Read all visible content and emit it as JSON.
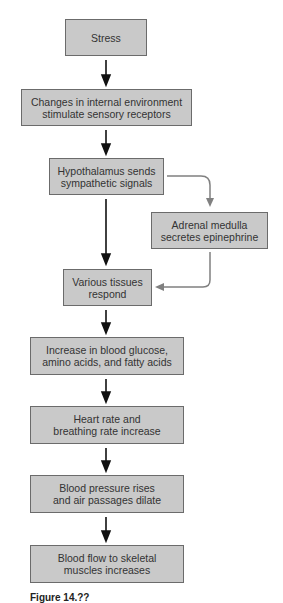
{
  "diagram": {
    "type": "flowchart",
    "nodes": [
      {
        "id": "stress",
        "label": "Stress"
      },
      {
        "id": "changes",
        "label": "Changes in internal environment\nstimulate sensory receptors"
      },
      {
        "id": "hypothalamus",
        "label": "Hypothalamus sends\nsympathetic signals"
      },
      {
        "id": "adrenal",
        "label": "Adrenal medulla\nsecretes epinephrine"
      },
      {
        "id": "tissues",
        "label": "Various tissues\nrespond"
      },
      {
        "id": "glucose",
        "label": "Increase in blood glucose,\namino acids, and fatty acids"
      },
      {
        "id": "heart",
        "label": "Heart rate and\nbreathing rate increase"
      },
      {
        "id": "pressure",
        "label": "Blood pressure rises\nand air passages dilate"
      },
      {
        "id": "bloodflow",
        "label": "Blood flow to skeletal\nmuscles increases"
      }
    ],
    "edges": [
      {
        "from": "stress",
        "to": "changes"
      },
      {
        "from": "changes",
        "to": "hypothalamus"
      },
      {
        "from": "hypothalamus",
        "to": "tissues"
      },
      {
        "from": "hypothalamus",
        "to": "adrenal",
        "style": "gray"
      },
      {
        "from": "adrenal",
        "to": "tissues",
        "style": "gray"
      },
      {
        "from": "tissues",
        "to": "glucose"
      },
      {
        "from": "glucose",
        "to": "heart"
      },
      {
        "from": "heart",
        "to": "pressure"
      },
      {
        "from": "pressure",
        "to": "bloodflow"
      }
    ],
    "colors": {
      "box_fill": "#c9c9c9",
      "box_border": "#6b6b6b",
      "arrow_main": "#111111",
      "arrow_secondary": "#808080"
    },
    "figure_label": "Figure 14.??"
  }
}
